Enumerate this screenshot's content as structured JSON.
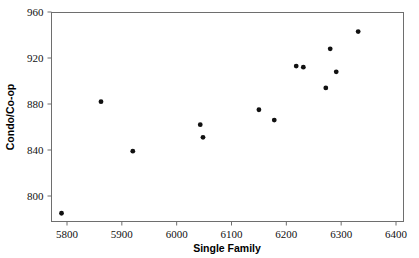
{
  "chart_data": {
    "type": "scatter",
    "title": "",
    "xlabel": "Single Family",
    "ylabel": "Condo/Co-op",
    "xlim": [
      5750,
      6400
    ],
    "ylim": [
      780,
      960
    ],
    "grid": false,
    "legend": null,
    "xticks": [
      "5800",
      "5900",
      "6000",
      "6100",
      "6200",
      "6300",
      "6400"
    ],
    "xtick_values": [
      5800,
      5900,
      6000,
      6100,
      6200,
      6300,
      6400
    ],
    "yticks": [
      "800",
      "840",
      "880",
      "920",
      "960"
    ],
    "ytick_values": [
      800,
      840,
      880,
      920,
      960
    ],
    "marker": "filled-circle",
    "marker_color": "#111111",
    "points": [
      {
        "x": 5790,
        "y": 785
      },
      {
        "x": 5862,
        "y": 882
      },
      {
        "x": 5920,
        "y": 839
      },
      {
        "x": 6043,
        "y": 862
      },
      {
        "x": 6048,
        "y": 851
      },
      {
        "x": 6150,
        "y": 875
      },
      {
        "x": 6178,
        "y": 866
      },
      {
        "x": 6218,
        "y": 913
      },
      {
        "x": 6231,
        "y": 912
      },
      {
        "x": 6272,
        "y": 894
      },
      {
        "x": 6280,
        "y": 928
      },
      {
        "x": 6291,
        "y": 908
      },
      {
        "x": 6331,
        "y": 943
      }
    ],
    "x": [
      5790,
      5862,
      5920,
      6043,
      6048,
      6150,
      6178,
      6218,
      6231,
      6272,
      6280,
      6291,
      6331
    ],
    "values": [
      785,
      882,
      839,
      862,
      851,
      875,
      866,
      913,
      912,
      894,
      928,
      908,
      943
    ]
  },
  "axis_colors": {
    "frame": "#6e6e6e",
    "text": "#111111",
    "marker": "#111111"
  }
}
